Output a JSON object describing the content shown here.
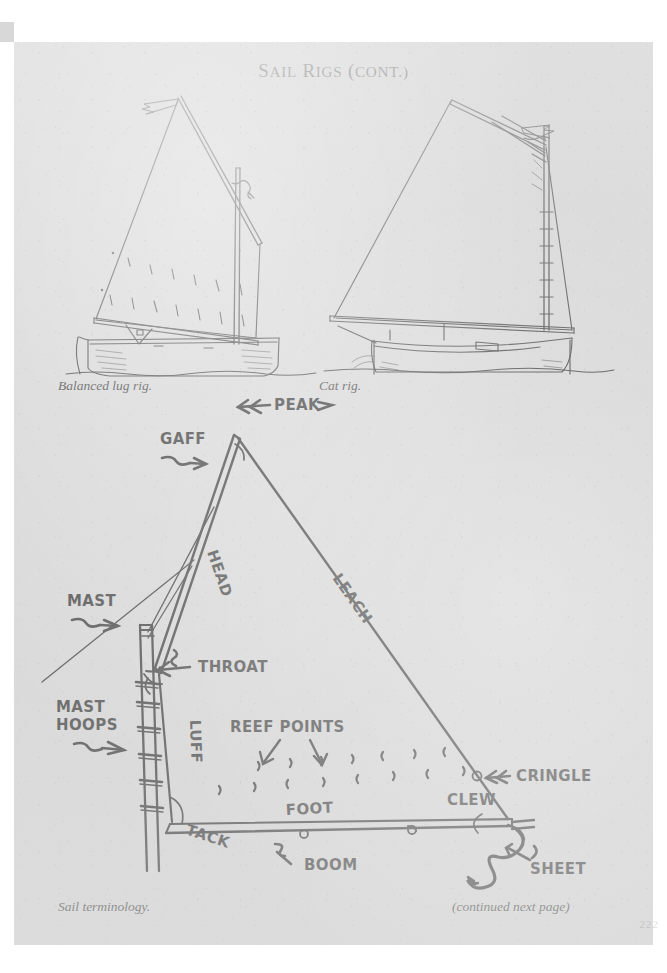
{
  "document": {
    "title_lead": "S",
    "title_rest_1": "AIL",
    "title_lead_2": "R",
    "title_rest_2": "IGS",
    "title_paren_open": "(",
    "title_cont": "CONT",
    "title_paren_close": ".)",
    "title_full": "SAIL RIGS (CONT.)",
    "page_number": "222",
    "paper_color": "#d9d9d9",
    "ink_color": "#141414"
  },
  "figures": [
    {
      "id": "balanced-lug-rig",
      "caption": "Balanced lug rig.",
      "description": "Profile line drawing of a small open boat rigged with a balanced lug sail: a four-sided sail set on an angled yard that crosses the mast, with the boom extending forward of the mast.",
      "parts": [
        "yard",
        "lug sail",
        "mast",
        "boom",
        "reef points",
        "hull",
        "waterline"
      ]
    },
    {
      "id": "cat-rig",
      "caption": "Cat rig.",
      "description": "Profile line drawing of a catboat: a single large gaff-headed sail set on a mast stepped far forward, with mast hoops on the luff and a long boom.",
      "parts": [
        "gaff",
        "gaff sail",
        "mast",
        "mast hoops",
        "boom",
        "hull",
        "waterline"
      ]
    },
    {
      "id": "sail-terminology",
      "caption": "Sail terminology.",
      "description": "Hand-lettered diagram of a gaff sail with every edge, corner and fitting labeled.",
      "labels": [
        {
          "key": "peak",
          "text": "PEAK",
          "arrow": "double-left"
        },
        {
          "key": "gaff",
          "text": "GAFF",
          "arrow": "squiggle-right"
        },
        {
          "key": "head",
          "text": "HEAD",
          "arrow": "none",
          "rotated": true
        },
        {
          "key": "leach",
          "text": "LEACH",
          "arrow": "none",
          "rotated": true
        },
        {
          "key": "mast",
          "text": "MAST",
          "arrow": "squiggle-right"
        },
        {
          "key": "throat",
          "text": "THROAT",
          "arrow": "squiggle-left"
        },
        {
          "key": "mast-hoops",
          "text": "MAST",
          "text2": "HOOPS",
          "arrow": "squiggle-right"
        },
        {
          "key": "luff",
          "text": "LUFF",
          "arrow": "none",
          "rotated": true
        },
        {
          "key": "reef-points",
          "text": "REEF POINTS",
          "arrow": "two-down"
        },
        {
          "key": "cringle",
          "text": "CRINGLE",
          "arrow": "double-left"
        },
        {
          "key": "clew",
          "text": "CLEW",
          "arrow": "none"
        },
        {
          "key": "tack",
          "text": "TACK",
          "arrow": "none"
        },
        {
          "key": "foot",
          "text": "FOOT",
          "arrow": "none"
        },
        {
          "key": "boom",
          "text": "BOOM",
          "arrow": "squiggle-up"
        },
        {
          "key": "sheet",
          "text": "SHEET",
          "arrow": "squiggle-up-left"
        }
      ]
    }
  ],
  "footer": {
    "continued": "(continued next page)"
  }
}
